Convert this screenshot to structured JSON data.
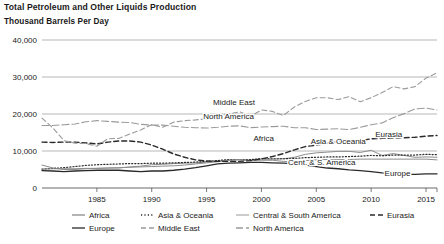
{
  "chart_data": {
    "type": "line",
    "title": "Total Petroleum and Other Liquids Production",
    "subtitle": "Thousand Barrels Per Day",
    "ylabel": "Thousand Barrels Per Day",
    "xlabel": "",
    "ylim": [
      0,
      40000
    ],
    "xlim": [
      1980,
      2016
    ],
    "grid": true,
    "legend_position": "bottom",
    "yticks": [
      "0",
      "10,000",
      "20,000",
      "30,000",
      "40,000"
    ],
    "ytick_values": [
      0,
      10000,
      20000,
      30000,
      40000
    ],
    "xticks": [
      "1985",
      "1990",
      "1995",
      "2000",
      "2005",
      "2010",
      "2015"
    ],
    "xtick_values": [
      1985,
      1990,
      1995,
      2000,
      2005,
      2010,
      2015
    ],
    "x": [
      1980,
      1981,
      1982,
      1983,
      1984,
      1985,
      1986,
      1987,
      1988,
      1989,
      1990,
      1991,
      1992,
      1993,
      1994,
      1995,
      1996,
      1997,
      1998,
      1999,
      2000,
      2001,
      2002,
      2003,
      2004,
      2005,
      2006,
      2007,
      2008,
      2009,
      2010,
      2011,
      2012,
      2013,
      2014,
      2015,
      2016
    ],
    "series": [
      {
        "name": "Africa",
        "label": "Africa",
        "style": "solid",
        "color": "#8c8c8c",
        "width": 1.0,
        "label_xy": [
          2000.2,
          12600
        ],
        "values": [
          6200,
          5400,
          5000,
          5000,
          5200,
          5300,
          5400,
          5400,
          5700,
          5900,
          6300,
          6400,
          6600,
          6700,
          6800,
          7000,
          7300,
          7500,
          7600,
          7500,
          7800,
          7800,
          7900,
          8300,
          9100,
          9500,
          9700,
          9900,
          9900,
          9600,
          10200,
          8800,
          9300,
          8800,
          8300,
          8400,
          8300
        ]
      },
      {
        "name": "Asia & Oceania",
        "label": "Asia & Oceania",
        "style": "dotted",
        "color": "#2a2a2a",
        "width": 1.2,
        "label_xy": [
          2007.0,
          12000
        ],
        "values": [
          5100,
          5300,
          5500,
          5800,
          6100,
          6300,
          6400,
          6500,
          6600,
          6600,
          6700,
          6700,
          6800,
          6900,
          7000,
          7200,
          7400,
          7700,
          7700,
          7700,
          7900,
          7900,
          7900,
          8000,
          8200,
          8300,
          8400,
          8400,
          8500,
          8600,
          8800,
          8700,
          8900,
          8900,
          8900,
          9100,
          9000
        ]
      },
      {
        "name": "Central & South America",
        "label": "Cent. & S. America",
        "style": "solid",
        "color": "#8c8c8c",
        "width": 1.0,
        "label_xy": [
          2005.5,
          6100
        ],
        "values": [
          5100,
          5200,
          5200,
          5200,
          5300,
          5300,
          5400,
          5500,
          5600,
          5700,
          5800,
          5900,
          6000,
          6200,
          6500,
          6800,
          7100,
          7500,
          7700,
          7400,
          7500,
          7500,
          7200,
          7100,
          7400,
          7600,
          7700,
          7700,
          7700,
          7800,
          7800,
          7800,
          7800,
          7800,
          7800,
          7800,
          7600
        ]
      },
      {
        "name": "Eurasia",
        "label": "Eurasia",
        "style": "dashed",
        "color": "#2a2a2a",
        "width": 1.4,
        "label_xy": [
          2011.6,
          13700
        ],
        "values": [
          12400,
          12300,
          12400,
          12400,
          12200,
          11900,
          12400,
          12700,
          12700,
          12400,
          11600,
          10500,
          9200,
          8300,
          7600,
          7300,
          7200,
          7200,
          7200,
          7400,
          7900,
          8500,
          9300,
          10300,
          11200,
          11600,
          12100,
          12600,
          12600,
          12800,
          13300,
          13400,
          13500,
          13600,
          13700,
          14000,
          14200
        ]
      },
      {
        "name": "Europe",
        "label": "Europe",
        "style": "solid",
        "color": "#2a2a2a",
        "width": 1.3,
        "label_xy": [
          2012.4,
          3300
        ],
        "values": [
          4700,
          4600,
          4400,
          4600,
          4700,
          4800,
          4800,
          4800,
          4600,
          4400,
          4600,
          4600,
          4800,
          5100,
          5500,
          6000,
          6500,
          6700,
          6800,
          6900,
          6900,
          6800,
          6700,
          6500,
          6200,
          5800,
          5400,
          5200,
          4900,
          4700,
          4400,
          4100,
          3900,
          3700,
          3700,
          3800,
          3800
        ]
      },
      {
        "name": "Middle East",
        "label": "Middle East",
        "style": "dashed",
        "color": "#9a9a9a",
        "width": 1.1,
        "label_xy": [
          1997.5,
          22500
        ],
        "values": [
          18900,
          16200,
          12800,
          12100,
          12000,
          11300,
          13300,
          13400,
          14600,
          15700,
          17100,
          16400,
          17800,
          18200,
          18400,
          18700,
          19300,
          20000,
          20600,
          19400,
          21100,
          20700,
          19600,
          21900,
          23400,
          24400,
          24400,
          23900,
          24700,
          23300,
          24400,
          25800,
          27400,
          26800,
          27400,
          29700,
          31100
        ]
      },
      {
        "name": "North America",
        "label": "North America",
        "style": "dashdot",
        "color": "#9a9a9a",
        "width": 1.1,
        "label_xy": [
          1997.0,
          18700
        ],
        "values": [
          16900,
          16900,
          17100,
          17300,
          17900,
          18200,
          18000,
          17800,
          17700,
          17200,
          17000,
          17000,
          16700,
          16400,
          16300,
          16200,
          16400,
          16700,
          16800,
          16300,
          16500,
          16600,
          16700,
          16300,
          16300,
          15800,
          15900,
          16000,
          15800,
          16400,
          17100,
          17600,
          19000,
          20100,
          21400,
          21600,
          21100
        ]
      }
    ],
    "legend": [
      {
        "label": "Africa",
        "style": "solid",
        "color": "#8c8c8c"
      },
      {
        "label": "Asia & Oceania",
        "style": "dotted",
        "color": "#2a2a2a"
      },
      {
        "label": "Central & South America",
        "style": "solid",
        "color": "#b0b0b0"
      },
      {
        "label": "Eurasia",
        "style": "dashed",
        "color": "#2a2a2a"
      },
      {
        "label": "Europe",
        "style": "solid",
        "color": "#2a2a2a"
      },
      {
        "label": "Middle East",
        "style": "dashed",
        "color": "#9a9a9a"
      },
      {
        "label": "North America",
        "style": "dashdot",
        "color": "#9a9a9a"
      }
    ]
  }
}
